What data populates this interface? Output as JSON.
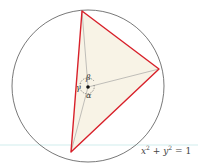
{
  "diagram": {
    "type": "inscribed-triangle-in-unit-circle",
    "circle": {
      "cx": 88,
      "cy": 86,
      "r": 76,
      "stroke": "#555555"
    },
    "triangle": {
      "vertices": [
        [
          82,
          11
        ],
        [
          159,
          69
        ],
        [
          71,
          152
        ]
      ],
      "stroke": "#d8202a",
      "fill": "#f8f3e6"
    },
    "center": {
      "x": 88,
      "y": 87
    },
    "angles": {
      "alpha": "α",
      "beta": "β",
      "gamma": "γ"
    },
    "equation": {
      "x": "x",
      "y": "y",
      "exp": "2",
      "plus": "+",
      "equals": "= 1"
    }
  }
}
